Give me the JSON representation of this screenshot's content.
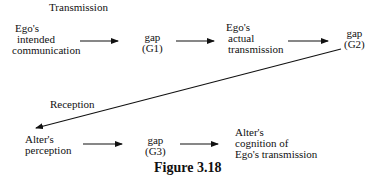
{
  "diagram": {
    "section_labels": {
      "transmission": "Transmission",
      "reception": "Reception"
    },
    "nodes": {
      "ego_intended": [
        "Ego's",
        "intended",
        "communication"
      ],
      "gap_g1": [
        "gap",
        "(G1)"
      ],
      "ego_actual": [
        "Ego's",
        "actual",
        "transmission"
      ],
      "gap_g2": [
        "gap",
        "(G2)"
      ],
      "alter_perception": [
        "Alter's",
        "perception"
      ],
      "gap_g3": [
        "gap",
        "(G3)"
      ],
      "alter_cognition": [
        "Alter's",
        "cognition of",
        "Ego's transmission"
      ]
    },
    "edges": [
      {
        "from": "ego_intended",
        "to": "gap_g1"
      },
      {
        "from": "gap_g1",
        "to": "ego_actual"
      },
      {
        "from": "ego_actual",
        "to": "gap_g2"
      },
      {
        "from": "gap_g2",
        "to": "alter_perception"
      },
      {
        "from": "alter_perception",
        "to": "gap_g3"
      },
      {
        "from": "gap_g3",
        "to": "alter_cognition"
      }
    ],
    "caption": "Figure 3.18"
  }
}
